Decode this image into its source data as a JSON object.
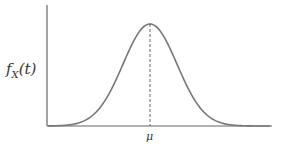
{
  "figure": {
    "type": "normal-density-curve",
    "y_axis_label": "f",
    "y_axis_label_sub": "X",
    "y_axis_label_arg": "(t)",
    "x_tick_label": "μ",
    "colors": {
      "curve": "#777777",
      "axes": "#666666",
      "dashed": "#555555",
      "text": "#333333"
    }
  },
  "chart_data": {
    "type": "line",
    "title": "",
    "xlabel": "",
    "ylabel": "f_X(t)",
    "series": [
      {
        "name": "normal pdf",
        "shape": "bell curve centered at mu"
      }
    ],
    "annotations": [
      {
        "type": "dashed-vertical-line",
        "at": "mu",
        "from": "x-axis",
        "to": "peak"
      },
      {
        "type": "tick-label",
        "text": "μ",
        "position": "x-axis at mean"
      }
    ],
    "grid": false,
    "legend": null
  }
}
